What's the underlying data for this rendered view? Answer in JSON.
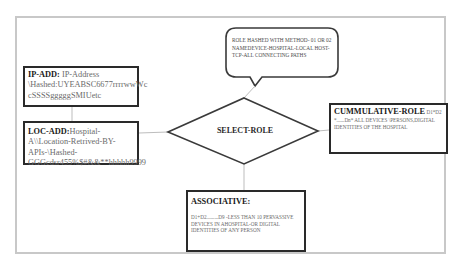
{
  "diagram": {
    "callout": {
      "text": "ROLE HASHED  WITH METHOD- 01 OR 02 NAMEDEVICE-HOSPITAL-LOCAL HOST-   TCP-ALL CONNECTING PATHS"
    },
    "ip_add": {
      "label": "IP-ADD",
      "separator": ": ",
      "value": "IP-Address \\Hashed:UYEABSC6677rrrrwwWc cSSSSgggggSMIUetc"
    },
    "loc_add": {
      "label": "LOC-ADD",
      "separator": ":",
      "value": "Hospital-A\\\\Location-Retrived-BY-APIs-\\Hashed-GGGcdsr455%$#&&**hhhhh9999"
    },
    "decision": {
      "label": "SELECT-ROLE"
    },
    "cumulative_role": {
      "label": "CUMMULATIVE-ROLE",
      "separator": " ",
      "value": "D1*D2 *......Dn*  ALL DEVICES \\PERSONS,DIGITAL IDENTITIES OF THE HOSPITAL"
    },
    "associative": {
      "label": "ASSOCIATIVE:",
      "value": "D1+D2.........D9 -LESS THAN 10 PERVASSIVE DEVICES IN AHOSPITAL-OR DIGITAL IDENTITIES OF ANY PERSON"
    }
  },
  "colors": {
    "frame": "#c8c8c8",
    "box_border": "#2a2a2a",
    "connector": "#bdbdbd",
    "label_text": "#1a1a1a",
    "value_text": "#6a6a6a"
  }
}
